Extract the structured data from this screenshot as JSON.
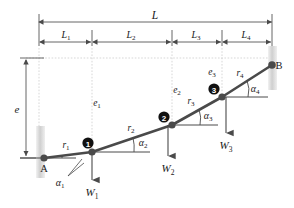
{
  "figure": {
    "supports": {
      "left_label": "A",
      "right_label": "B"
    },
    "overall_dimension": {
      "label": "L",
      "x_start_px": 39,
      "x_end_px": 272,
      "y_px": 22
    },
    "segment_dimensions": [
      {
        "label": "L",
        "subscript": "1",
        "x_start_px": 39,
        "x_end_px": 92,
        "y_px": 42
      },
      {
        "label": "L",
        "subscript": "2",
        "x_start_px": 92,
        "x_end_px": 172,
        "y_px": 42
      },
      {
        "label": "L",
        "subscript": "3",
        "x_start_px": 172,
        "x_end_px": 222,
        "y_px": 42
      },
      {
        "label": "L",
        "subscript": "4",
        "x_start_px": 222,
        "x_end_px": 272,
        "y_px": 42
      }
    ],
    "height_dimension": {
      "label": "e",
      "x_px": 26,
      "y_top_px": 58,
      "y_bottom_px": 158
    },
    "offsets": [
      {
        "label": "e",
        "subscript": "1",
        "x_px": 97,
        "y_px": 103
      },
      {
        "label": "e",
        "subscript": "2",
        "x_px": 174,
        "y_px": 90
      },
      {
        "label": "e",
        "subscript": "3",
        "x_px": 210,
        "y_px": 72
      }
    ],
    "nodes": [
      {
        "id": "A",
        "label": "A",
        "x_px": 44,
        "y_px": 158,
        "kind": "support-pin",
        "filled": true
      },
      {
        "id": "1",
        "label": "1",
        "x_px": 92,
        "y_px": 152,
        "kind": "joint",
        "filled": true
      },
      {
        "id": "2",
        "label": "2",
        "x_px": 172,
        "y_px": 125,
        "kind": "joint",
        "filled": true
      },
      {
        "id": "3",
        "label": "3",
        "x_px": 222,
        "y_px": 97,
        "kind": "joint",
        "filled": true
      },
      {
        "id": "B",
        "label": "B",
        "x_px": 272,
        "y_px": 65,
        "kind": "support-roller",
        "filled": true
      }
    ],
    "members": [
      {
        "label": "r",
        "subscript": "1",
        "label_x_px": 66,
        "label_y_px": 146
      },
      {
        "label": "r",
        "subscript": "2",
        "label_x_px": 130,
        "label_y_px": 130
      },
      {
        "label": "r",
        "subscript": "3",
        "label_x_px": 190,
        "label_y_px": 102
      },
      {
        "label": "r",
        "subscript": "4",
        "label_x_px": 238,
        "label_y_px": 74
      }
    ],
    "angles": [
      {
        "label": "α",
        "subscript": "1",
        "label_x_px": 60,
        "label_y_px": 182
      },
      {
        "label": "α",
        "subscript": "2",
        "label_x_px": 141,
        "label_y_px": 143
      },
      {
        "label": "α",
        "subscript": "3",
        "label_x_px": 205,
        "label_y_px": 115
      },
      {
        "label": "α",
        "subscript": "4",
        "label_x_px": 252,
        "label_y_px": 89
      }
    ],
    "loads": [
      {
        "label": "W",
        "subscript": "1",
        "x_px": 92,
        "arrow_top_px": 152,
        "arrow_bottom_px": 179,
        "label_x_px": 92,
        "label_y_px": 193
      },
      {
        "label": "W",
        "subscript": "2",
        "x_px": 168,
        "arrow_top_px": 125,
        "arrow_bottom_px": 155,
        "label_x_px": 168,
        "label_y_px": 169
      },
      {
        "label": "W",
        "subscript": "3",
        "x_px": 226,
        "arrow_top_px": 97,
        "arrow_bottom_px": 132,
        "label_x_px": 226,
        "label_y_px": 147
      }
    ],
    "colors": {
      "line": "#3a3a3a",
      "dimension": "#555555",
      "guide": "#b8b8b8",
      "node_fill": "#4a4a4a",
      "node_badge": "#111111",
      "support": "#cfcfcf",
      "text": "#1a1a1a",
      "background": "#ffffff"
    }
  }
}
